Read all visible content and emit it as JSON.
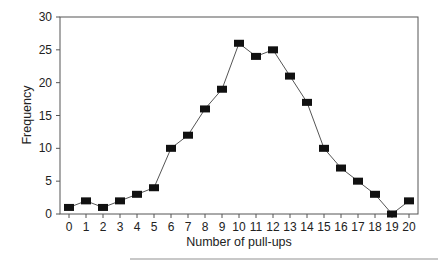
{
  "chart_data": {
    "type": "line",
    "title": "",
    "xlabel": "Number of pull-ups",
    "ylabel": "Frequency",
    "x": [
      0,
      1,
      2,
      3,
      4,
      5,
      6,
      7,
      8,
      9,
      10,
      11,
      12,
      13,
      14,
      15,
      16,
      17,
      18,
      19,
      20
    ],
    "series": [
      {
        "name": "Frequency",
        "values": [
          1,
          2,
          1,
          2,
          3,
          4,
          10,
          12,
          16,
          19,
          26,
          24,
          25,
          21,
          17,
          10,
          7,
          5,
          3,
          0,
          2
        ],
        "marker": "square",
        "color": "#111111",
        "line_color": "#555555"
      }
    ],
    "xlim": [
      0,
      20
    ],
    "ylim": [
      0,
      30
    ],
    "xticks": [
      0,
      1,
      2,
      3,
      4,
      5,
      6,
      7,
      8,
      9,
      10,
      11,
      12,
      13,
      14,
      15,
      16,
      17,
      18,
      19,
      20
    ],
    "yticks": [
      0,
      5,
      10,
      15,
      20,
      25,
      30
    ],
    "grid": false,
    "legend": null
  }
}
